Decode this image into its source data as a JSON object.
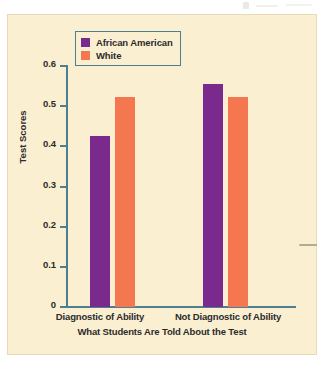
{
  "chart_data": {
    "type": "bar",
    "title": "",
    "xlabel": "What Students Are Told About the Test",
    "ylabel": "Test Scores",
    "categories": [
      "Diagnostic of Ability",
      "Not Diagnostic of Ability"
    ],
    "series": [
      {
        "name": "African American",
        "values": [
          0.425,
          0.555
        ],
        "color": "#7a2a8c"
      },
      {
        "name": "White",
        "values": [
          0.522,
          0.522
        ],
        "color": "#f4774f"
      }
    ],
    "ylim": [
      0,
      0.6
    ],
    "yticks": [
      "0",
      "0.1",
      "0.2",
      "0.3",
      "0.4",
      "0.5",
      "0.6"
    ],
    "ytick_values": [
      0,
      0.1,
      0.2,
      0.3,
      0.4,
      0.5,
      0.6
    ],
    "grid": false,
    "legend_position": "top-left-inside"
  },
  "legend": {
    "items": [
      {
        "label": "African American",
        "color": "#7a2a8c"
      },
      {
        "label": "White",
        "color": "#f4774f"
      }
    ]
  },
  "axes": {
    "y_title": "Test Scores",
    "x_title": "What Students Are Told About the Test",
    "tick_labels": [
      "0.6",
      "0.5",
      "0.4",
      "0.3",
      "0.2",
      "0.1",
      "0"
    ],
    "category_labels": [
      "Diagnostic of Ability",
      "Not Diagnostic of Ability"
    ],
    "axis_color": "#4e7f91"
  },
  "colors": {
    "background": "#faf0d1",
    "page": "#ffffff",
    "axis": "#4e7f91",
    "series_african_american": "#7a2a8c",
    "series_white": "#f4774f",
    "text": "#2b2b2b"
  }
}
